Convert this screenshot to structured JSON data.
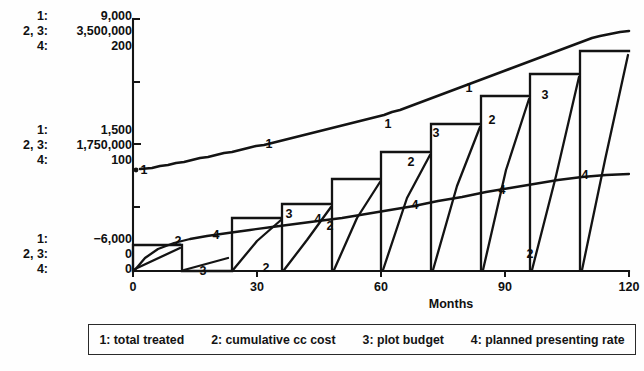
{
  "axis_labels": {
    "top": [
      {
        "series": "1:",
        "value": "9,000"
      },
      {
        "series": "2, 3:",
        "value": "3,500,000"
      },
      {
        "series": "4:",
        "value": "200"
      }
    ],
    "middle": [
      {
        "series": "1:",
        "value": "1,500"
      },
      {
        "series": "2, 3:",
        "value": "1,750,000"
      },
      {
        "series": "4:",
        "value": "100"
      }
    ],
    "bottom": [
      {
        "series": "1:",
        "value": "−6,000"
      },
      {
        "series": "2, 3:",
        "value": "0"
      },
      {
        "series": "4:",
        "value": "0"
      }
    ]
  },
  "xaxis": {
    "label": "Months",
    "ticks": [
      "0",
      "30",
      "60",
      "90",
      "120"
    ],
    "min": 0,
    "max": 120
  },
  "legend": {
    "entries": [
      "1: total treated",
      "2: cumulative cc cost",
      "3: plot budget",
      "4: planned presenting rate"
    ]
  },
  "callouts": [
    {
      "text": "1",
      "x": 144,
      "y": 170
    },
    {
      "text": "1",
      "x": 269,
      "y": 144
    },
    {
      "text": "1",
      "x": 388,
      "y": 124
    },
    {
      "text": "1",
      "x": 469,
      "y": 88
    },
    {
      "text": "2",
      "x": 178,
      "y": 241
    },
    {
      "text": "2",
      "x": 266,
      "y": 268
    },
    {
      "text": "2",
      "x": 330,
      "y": 226
    },
    {
      "text": "2",
      "x": 411,
      "y": 162
    },
    {
      "text": "2",
      "x": 492,
      "y": 120
    },
    {
      "text": "2",
      "x": 530,
      "y": 254
    },
    {
      "text": "3",
      "x": 203,
      "y": 271
    },
    {
      "text": "3",
      "x": 289,
      "y": 214
    },
    {
      "text": "3",
      "x": 436,
      "y": 133
    },
    {
      "text": "3",
      "x": 545,
      "y": 95
    },
    {
      "text": "4",
      "x": 216,
      "y": 235
    },
    {
      "text": "4",
      "x": 318,
      "y": 219
    },
    {
      "text": "4",
      "x": 415,
      "y": 205
    },
    {
      "text": "4",
      "x": 502,
      "y": 190
    },
    {
      "text": "4",
      "x": 585,
      "y": 175
    }
  ],
  "chart_data": {
    "type": "line",
    "title": "",
    "xlabel": "Months",
    "ylabel": "",
    "xlim": [
      0,
      120
    ],
    "grid": false,
    "legend_position": "bottom",
    "axis_scales": {
      "series_1": {
        "name": "total treated",
        "min": -6000,
        "mid": 1500,
        "max": 9000
      },
      "series_2_3": {
        "name": "cumulative cc cost / plot budget",
        "min": 0,
        "mid": 1750000,
        "max": 3500000
      },
      "series_4": {
        "name": "planned presenting rate",
        "min": 0,
        "mid": 100,
        "max": 200
      }
    },
    "series": [
      {
        "name": "total treated",
        "key": "1",
        "units": "patients",
        "x": [
          0,
          4,
          8,
          12,
          16,
          20,
          24,
          28,
          32,
          36,
          40,
          44,
          48,
          52,
          56,
          60,
          64,
          68,
          72,
          76,
          80,
          84,
          88,
          92,
          96,
          100,
          104,
          108,
          112,
          116,
          120
        ],
        "values": [
          1500,
          1560,
          1640,
          1720,
          1810,
          1900,
          2000,
          2110,
          2230,
          2350,
          2480,
          2620,
          2780,
          2950,
          3130,
          3320,
          3520,
          3740,
          3980,
          4230,
          4500,
          4790,
          5100,
          5430,
          5790,
          6180,
          6590,
          7030,
          7500,
          8000,
          8550
        ]
      },
      {
        "name": "cumulative cc cost",
        "key": "2",
        "units": "dollars",
        "description": "sawtooth: ramps up within each budget cycle then resets to 0",
        "cycles": [
          {
            "start_month": 0,
            "end_month": 12,
            "start_value": 0,
            "end_value": 330000
          },
          {
            "start_month": 12,
            "end_month": 24,
            "start_value": 0,
            "end_value": 150000
          },
          {
            "start_month": 24,
            "end_month": 36,
            "start_value": 0,
            "end_value": 700000
          },
          {
            "start_month": 36,
            "end_month": 48,
            "start_value": 0,
            "end_value": 880000
          },
          {
            "start_month": 48,
            "end_month": 60,
            "start_value": 0,
            "end_value": 1220000
          },
          {
            "start_month": 60,
            "end_month": 72,
            "start_value": 0,
            "end_value": 1600000
          },
          {
            "start_month": 72,
            "end_month": 84,
            "start_value": 0,
            "end_value": 1980000
          },
          {
            "start_month": 84,
            "end_month": 96,
            "start_value": 0,
            "end_value": 2380000
          },
          {
            "start_month": 96,
            "end_month": 108,
            "start_value": 0,
            "end_value": 2680000
          },
          {
            "start_month": 108,
            "end_month": 120,
            "start_value": 0,
            "end_value": 3050000
          }
        ]
      },
      {
        "name": "plot budget",
        "key": "3",
        "units": "dollars",
        "description": "step function: holds a constant budget for each cycle then drops to 0",
        "steps": [
          {
            "start_month": 0,
            "end_month": 12,
            "value": 350000
          },
          {
            "start_month": 12,
            "end_month": 24,
            "value": 0
          },
          {
            "start_month": 24,
            "end_month": 36,
            "value": 740000
          },
          {
            "start_month": 36,
            "end_month": 48,
            "value": 930000
          },
          {
            "start_month": 48,
            "end_month": 60,
            "value": 1280000
          },
          {
            "start_month": 60,
            "end_month": 72,
            "value": 1660000
          },
          {
            "start_month": 72,
            "end_month": 84,
            "value": 2050000
          },
          {
            "start_month": 84,
            "end_month": 96,
            "value": 2450000
          },
          {
            "start_month": 96,
            "end_month": 108,
            "value": 2760000
          },
          {
            "start_month": 108,
            "end_month": 120,
            "value": 3120000
          }
        ]
      },
      {
        "name": "planned presenting rate",
        "key": "4",
        "units": "patients per month",
        "x": [
          0,
          10,
          20,
          30,
          40,
          50,
          60,
          70,
          80,
          90,
          100,
          110,
          120
        ],
        "values": [
          0,
          22,
          39,
          50,
          57,
          63,
          68,
          73,
          78,
          83,
          88,
          93,
          97
        ]
      }
    ]
  }
}
